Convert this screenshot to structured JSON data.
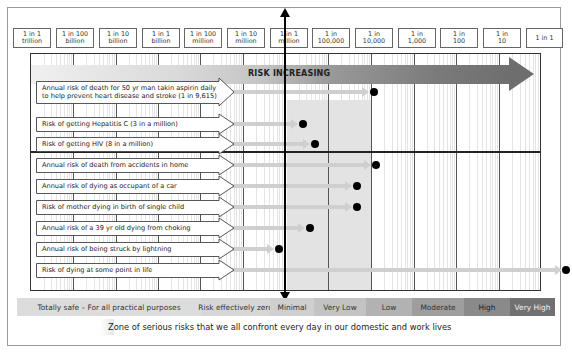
{
  "chart_data": {
    "type": "scatter",
    "title": "",
    "xlabel": "Risk (probability, log scale)",
    "ylabel": "",
    "x_scale": "log",
    "x_ticks": [
      "1 in 1 trillion",
      "1 in 100 billion",
      "1 in 10 billion",
      "1 in 1 billion",
      "1 in 100 million",
      "1 in 10 million",
      "1 in 1 million",
      "1 in 100,000",
      "1 in 10,000",
      "1 in 1,000",
      "1 in 100",
      "1 in 10",
      "1 in 1"
    ],
    "risk_arrow_label": "RISK INCREASING",
    "grid": true,
    "legend_position": "bottom",
    "series": [
      {
        "name": "Annual risk of death for 50 yr man takin aspirin daily to help prevent heart disease and stroke (1 in 9,615)",
        "value": 0.000104
      },
      {
        "name": "Risk of getting Hepatitis C (3 in a million)",
        "value": 3e-06
      },
      {
        "name": "Risk of getting HIV (8 in a million)",
        "value": 8e-06
      },
      {
        "name": "Annual risk of death from accidents in home",
        "value": 0.0001
      },
      {
        "name": "Annual risk of dying as occupant of a car",
        "value": 4e-05
      },
      {
        "name": "Risk of mother dying in birth of single child",
        "value": 4e-05
      },
      {
        "name": "Annual risk of a 39 yr old dying from choking",
        "value": 5e-06
      },
      {
        "name": "Annual risk of being struck by lightning",
        "value": 7e-07
      },
      {
        "name": "Risk of dying at some point in life",
        "value": 1
      }
    ],
    "risk_bands": [
      "Totally safe – For all practical purposes",
      "Risk effectively zero",
      "Minimal",
      "Very Low",
      "Low",
      "Moderate",
      "High",
      "Very High"
    ],
    "annotation": "Zone of serious risks that we all confront every day in our domestic and work lives"
  },
  "scale": [
    {
      "l1": "1 in 1",
      "l2": "trillion"
    },
    {
      "l1": "1 in 100",
      "l2": "billion"
    },
    {
      "l1": "1 in 10",
      "l2": "billion"
    },
    {
      "l1": "1 in 1",
      "l2": "billion"
    },
    {
      "l1": "1 in 100",
      "l2": "million"
    },
    {
      "l1": "1 in 10",
      "l2": "million"
    },
    {
      "l1": "1 in 1",
      "l2": "million"
    },
    {
      "l1": "1 in",
      "l2": "100,000"
    },
    {
      "l1": "1 in",
      "l2": "10,000"
    },
    {
      "l1": "1 in",
      "l2": "1,000"
    },
    {
      "l1": "1 in",
      "l2": "100"
    },
    {
      "l1": "1 in",
      "l2": "10"
    },
    {
      "l1": "1 in 1",
      "l2": ""
    }
  ],
  "risk_label": "RISK INCREASING",
  "rows": [
    {
      "l1": "Annual risk of death for 50 yr man takin aspirin daily",
      "l2": "to help prevent heart disease and stroke (1 in 9,615)"
    },
    {
      "l1": "Risk of getting Hepatitis C (3 in a million)",
      "l2": ""
    },
    {
      "l1": "Risk of getting HIV (8 in a million)",
      "l2": ""
    },
    {
      "l1": "Annual risk of death from accidents in home",
      "l2": ""
    },
    {
      "l1": "Annual risk of dying as occupant of a car",
      "l2": ""
    },
    {
      "l1": "Risk of mother dying in birth of single child",
      "l2": ""
    },
    {
      "l1": "Annual risk of a 39 yr old dying from choking",
      "l2": ""
    },
    {
      "l1": "Annual risk of being struck by lightning",
      "l2": ""
    },
    {
      "l1": "Risk of dying at some point in life",
      "l2": ""
    }
  ],
  "legend": [
    {
      "label": "Totally safe – For all practical purposes",
      "color": "#dcdcdc",
      "text": "#333"
    },
    {
      "label": "Risk effectively zero",
      "color": "#d6d6d6",
      "text": "#333"
    },
    {
      "label": "Minimal",
      "color": "#cfcfcf",
      "text": "#333"
    },
    {
      "label": "Very Low",
      "color": "#c3c3c3",
      "text": "#333"
    },
    {
      "label": "Low",
      "color": "#b2b2b2",
      "text": "#333"
    },
    {
      "label": "Moderate",
      "color": "#9e9e9e",
      "text": "#333"
    },
    {
      "label": "High",
      "color": "#8a8a8a",
      "text": "#222"
    },
    {
      "label": "Very High",
      "color": "#707070",
      "text": "#f2f2f2"
    }
  ],
  "caption": "Zone of serious risks that we all confront every day in our domestic and work lives"
}
